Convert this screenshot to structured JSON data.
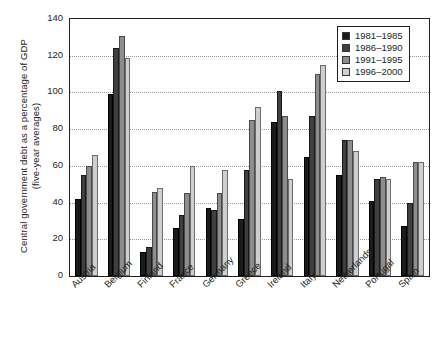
{
  "chart_data": {
    "type": "bar",
    "title": "",
    "xlabel": "",
    "ylabel": "Central government debt as a percentage of GDP",
    "ylabel_line2": "(five-year averages)",
    "ylim": [
      0,
      140
    ],
    "ytick_step": 20,
    "yticks": [
      "0",
      "20",
      "40",
      "60",
      "80",
      "100",
      "120",
      "140"
    ],
    "grid": true,
    "legend_position": "top-right",
    "categories": [
      "Austria",
      "Belgium",
      "Finland",
      "France",
      "Germany",
      "Greece",
      "Ireland",
      "Italy",
      "Netherlands",
      "Portugal",
      "Spain"
    ],
    "series": [
      {
        "name": "1981–1985",
        "color": "#1b1b1b",
        "values": [
          42,
          99,
          13,
          26,
          37,
          31,
          84,
          65,
          55,
          41,
          27
        ]
      },
      {
        "name": "1986–1990",
        "color": "#3f3f3f",
        "values": [
          55,
          124,
          16,
          33,
          36,
          58,
          101,
          87,
          74,
          53,
          40
        ]
      },
      {
        "name": "1991–1995",
        "color": "#8d8d8d",
        "values": [
          60,
          131,
          46,
          45,
          45,
          85,
          87,
          110,
          74,
          54,
          62
        ]
      },
      {
        "name": "1996–2000",
        "color": "#cfcfcf",
        "values": [
          66,
          119,
          48,
          60,
          58,
          92,
          53,
          115,
          68,
          53,
          62
        ]
      }
    ]
  }
}
